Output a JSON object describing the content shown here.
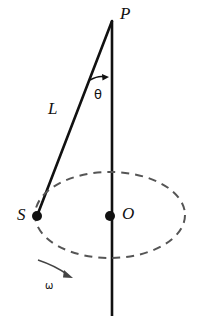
{
  "figure": {
    "labels": {
      "apex": "P",
      "angle": "θ",
      "length": "L",
      "bob": "S",
      "center": "O",
      "angular_velocity": "ω"
    },
    "colors": {
      "stroke": "#111111",
      "dashed": "#555555",
      "background": "#ffffff"
    },
    "geometry": {
      "apex_point": [
        112,
        21
      ],
      "axis_line": [
        [
          112,
          21
        ],
        [
          112,
          316
        ]
      ],
      "string_line": [
        [
          112,
          21
        ],
        [
          37,
          216
        ]
      ],
      "bob_dot": [
        37,
        216
      ],
      "center_dot": [
        110,
        216
      ],
      "circle_ellipse": {
        "cx": 110,
        "cy": 215,
        "rx": 75,
        "ry": 43
      },
      "angle_arrow": [
        [
          91,
          80
        ],
        [
          108,
          77
        ]
      ],
      "omega_arrow": [
        [
          39,
          261
        ],
        [
          73,
          277
        ]
      ]
    },
    "icons": {
      "bob_marker": "filled-dot",
      "center_marker": "filled-dot",
      "angle_marker": "arrow-head",
      "rotation_marker": "arrow-head"
    }
  }
}
